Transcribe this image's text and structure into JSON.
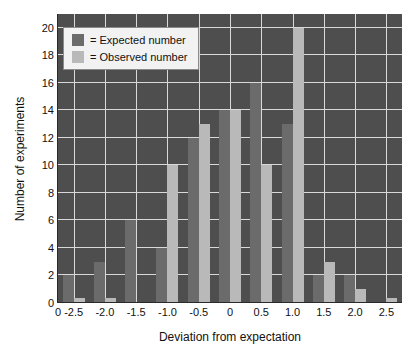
{
  "chart_data": {
    "type": "bar",
    "title": "",
    "xlabel": "Deviation from expectation",
    "ylabel": "Number of experiments",
    "xlim": [
      -2.75,
      2.75
    ],
    "ylim": [
      0,
      21
    ],
    "grid": true,
    "legend_position": "upper-left",
    "categories": [
      "-2.5",
      "-2.0",
      "-1.5",
      "-1.0",
      "-0.5",
      "0",
      "0.5",
      "1.0",
      "1.5",
      "2.0",
      "2.5"
    ],
    "series": [
      {
        "name": "Expected number",
        "color": "#6b6b6b",
        "values": [
          2,
          3,
          6,
          4,
          12,
          14,
          16,
          13,
          2,
          2,
          0
        ]
      },
      {
        "name": "Observed number",
        "color": "#b9b9b9",
        "values": [
          0.4,
          0.4,
          0,
          10,
          13,
          14,
          10,
          20,
          3,
          1,
          0.4
        ]
      }
    ],
    "y_ticks": [
      "0",
      "2",
      "4",
      "6",
      "8",
      "10",
      "12",
      "14",
      "16",
      "18",
      "20"
    ],
    "y_tick_values": [
      0,
      2,
      4,
      6,
      8,
      10,
      12,
      14,
      16,
      18,
      20
    ],
    "x_ticks": [
      "0",
      "-2.5",
      "-2.0",
      "-1.5",
      "-1.0",
      "-0.5",
      "0",
      "0.5",
      "1.0",
      "1.5",
      "2.0",
      "2.5"
    ],
    "x_tick_values": [
      -2.75,
      -2.5,
      -2.0,
      -1.5,
      -1.0,
      -0.5,
      0,
      0.5,
      1.0,
      1.5,
      2.0,
      2.5
    ],
    "plot_background": "#4e4e4e",
    "grid_color": "#d9d9d9"
  },
  "legend": {
    "items": [
      {
        "label": "= Expected number",
        "swatch": "expected"
      },
      {
        "label": "= Observed number",
        "swatch": "observed"
      }
    ]
  }
}
